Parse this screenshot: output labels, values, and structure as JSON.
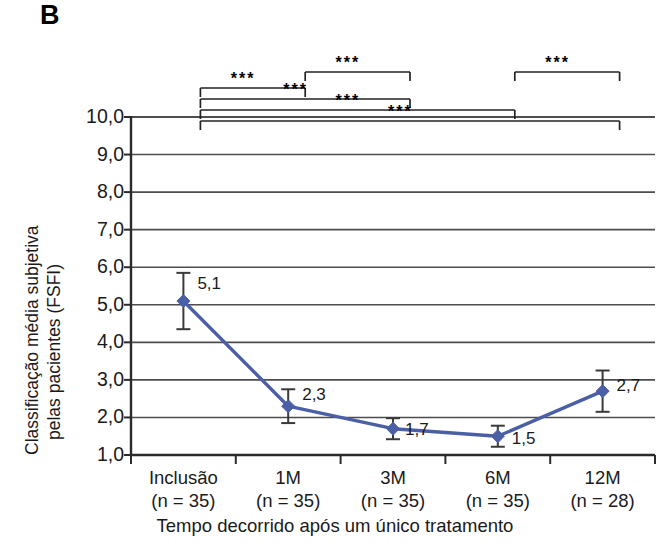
{
  "panel": {
    "label": "B"
  },
  "chart_data": {
    "type": "line",
    "title": "",
    "subtitle": "",
    "xlabel": "Tempo decorrido após um único tratamento",
    "ylabel_line1": "Classificação média subjetiva",
    "ylabel_line2": "pelas pacientes (FSFI)",
    "categories": [
      "Inclusão",
      "1M",
      "3M",
      "6M",
      "12M"
    ],
    "category_sublabels": [
      "(n = 35)",
      "(n = 35)",
      "(n = 35)",
      "(n = 35)",
      "(n = 28)"
    ],
    "n_values": [
      35,
      35,
      35,
      35,
      28
    ],
    "values": [
      5.1,
      2.3,
      1.7,
      1.5,
      2.7
    ],
    "value_labels": [
      "5,1",
      "2,3",
      "1,7",
      "1,5",
      "2,7"
    ],
    "error_upper": [
      0.75,
      0.45,
      0.28,
      0.28,
      0.55
    ],
    "error_lower": [
      0.75,
      0.45,
      0.28,
      0.28,
      0.55
    ],
    "ylim": [
      1.0,
      10.0
    ],
    "ytick_values": [
      10.0,
      9.0,
      8.0,
      7.0,
      6.0,
      5.0,
      4.0,
      3.0,
      2.0,
      1.0
    ],
    "ytick_labels": [
      "10,0",
      "9,0",
      "8,0",
      "7,0",
      "6,0",
      "5,0",
      "4,0",
      "3,0",
      "2,0",
      "1,0"
    ],
    "grid": true,
    "legend": "none",
    "series_name": "FSFI",
    "line_color": "#4a5fa5",
    "marker_color": "#4a5fa5",
    "marker_shape": "diamond",
    "errorbar_color": "#3a3a3a",
    "grid_color": "#4d4d4d",
    "axis_color": "#2b2b2b",
    "annotations": [
      {
        "from": "Inclusão",
        "to": "1M",
        "label": "***",
        "level": 1
      },
      {
        "from": "1M",
        "to": "3M",
        "label": "***",
        "level": 0
      },
      {
        "from": "Inclusão",
        "to": "3M",
        "label": "***",
        "level": 2
      },
      {
        "from": "Inclusão",
        "to": "6M",
        "label": "***",
        "level": 3
      },
      {
        "from": "6M",
        "to": "12M",
        "label": "***",
        "level": 0
      },
      {
        "from": "Inclusão",
        "to": "12M",
        "label": "***",
        "level": 4
      }
    ]
  }
}
